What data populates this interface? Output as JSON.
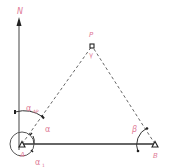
{
  "diagram": {
    "colors": {
      "label": "#e07a96",
      "line": "#333333",
      "dashed": "#555555"
    },
    "labels": {
      "north": "N",
      "point_p": "P",
      "gamma": "γ",
      "point_a": "A",
      "point_b": "B",
      "alpha_ap": "α",
      "alpha_ap_sub": "AP",
      "alpha": "α",
      "alpha_1": "α",
      "alpha_1_sub": "1",
      "beta": "β"
    },
    "points": {
      "N_arrow_tip": [
        19,
        20
      ],
      "A": [
        22,
        144
      ],
      "B": [
        155,
        144
      ],
      "P": [
        92,
        46
      ]
    }
  }
}
